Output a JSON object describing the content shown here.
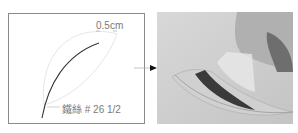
{
  "diagram": {
    "gap_label": "0.5cm",
    "wire_label": "鐵絲 # 26 1/2"
  },
  "photo": {
    "description": "hand bending wire-edged petal"
  }
}
